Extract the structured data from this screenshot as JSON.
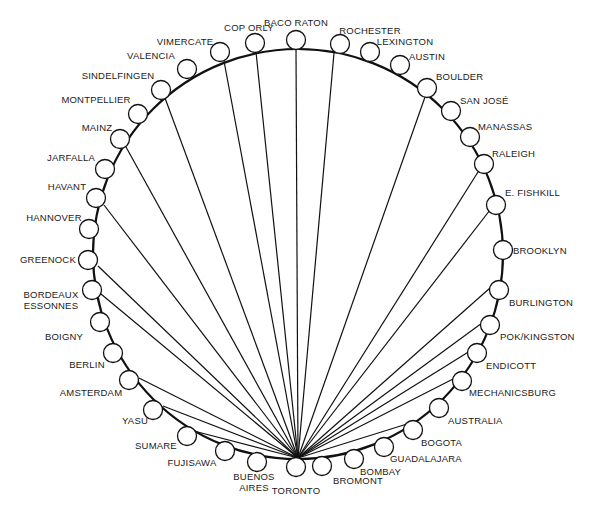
{
  "diagram": {
    "type": "star-network-on-ring",
    "hub": "TORONTO",
    "ring": {
      "cx": 298,
      "cy": 254,
      "r": 205,
      "stroke": "#111111"
    },
    "node_radius": 9.5,
    "nodes": [
      {
        "id": "baco-raton",
        "label": [
          "BACO RATON"
        ],
        "x": 296,
        "y": 40,
        "lx": 296,
        "ly": 26,
        "anchor": "middle",
        "connected": true,
        "ex": 296,
        "ey": 49
      },
      {
        "id": "rochester",
        "label": [
          "ROCHESTER"
        ],
        "x": 340,
        "y": 44,
        "lx": 370,
        "ly": 34,
        "anchor": "middle",
        "connected": true,
        "ex": 334,
        "ey": 53
      },
      {
        "id": "lexington",
        "label": [
          "LEXINGTON"
        ],
        "x": 370,
        "y": 52,
        "lx": 405,
        "ly": 45,
        "anchor": "middle",
        "connected": false
      },
      {
        "id": "austin",
        "label": [
          "AUSTIN"
        ],
        "x": 400,
        "y": 65,
        "lx": 427,
        "ly": 60,
        "anchor": "middle",
        "connected": false
      },
      {
        "id": "boulder",
        "label": [
          "BOULDER"
        ],
        "x": 427,
        "y": 88,
        "lx": 436,
        "ly": 80,
        "anchor": "start",
        "connected": true,
        "ex": 425,
        "ey": 97
      },
      {
        "id": "san-jose",
        "label": [
          "SAN JOSÉ"
        ],
        "x": 451,
        "y": 111,
        "lx": 460,
        "ly": 104,
        "anchor": "start",
        "connected": false
      },
      {
        "id": "manassas",
        "label": [
          "MANASSAS"
        ],
        "x": 470,
        "y": 137,
        "lx": 478,
        "ly": 130,
        "anchor": "start",
        "connected": false
      },
      {
        "id": "raleigh",
        "label": [
          "RALEIGH"
        ],
        "x": 484,
        "y": 164,
        "lx": 492,
        "ly": 157,
        "anchor": "start",
        "connected": true,
        "ex": 478,
        "ey": 172
      },
      {
        "id": "e-fishkill",
        "label": [
          "E. FISHKILL"
        ],
        "x": 496,
        "y": 205,
        "lx": 505,
        "ly": 196,
        "anchor": "start",
        "connected": true,
        "ex": 490,
        "ey": 210
      },
      {
        "id": "brooklyn",
        "label": [
          "BROOKLYN"
        ],
        "x": 503,
        "y": 250,
        "lx": 513,
        "ly": 254,
        "anchor": "start",
        "connected": false
      },
      {
        "id": "burlington",
        "label": [
          "BURLINGTON"
        ],
        "x": 499,
        "y": 290,
        "lx": 509,
        "ly": 306,
        "anchor": "start",
        "connected": true,
        "ex": 490,
        "ey": 288
      },
      {
        "id": "pok-kingston",
        "label": [
          "POK/KINGSTON"
        ],
        "x": 490,
        "y": 325,
        "lx": 500,
        "ly": 340,
        "anchor": "start",
        "connected": true,
        "ex": 482,
        "ey": 323
      },
      {
        "id": "endicott",
        "label": [
          "ENDICOTT"
        ],
        "x": 477,
        "y": 353,
        "lx": 486,
        "ly": 369,
        "anchor": "start",
        "connected": true,
        "ex": 470,
        "ey": 351
      },
      {
        "id": "mechanicsburg",
        "label": [
          "MECHANICSBURG"
        ],
        "x": 462,
        "y": 381,
        "lx": 469,
        "ly": 396,
        "anchor": "start",
        "connected": true,
        "ex": 455,
        "ey": 378
      },
      {
        "id": "australia",
        "label": [
          "AUSTRALIA"
        ],
        "x": 439,
        "y": 408,
        "lx": 448,
        "ly": 424,
        "anchor": "start",
        "connected": false
      },
      {
        "id": "bogota",
        "label": [
          "BOGOTA"
        ],
        "x": 413,
        "y": 430,
        "lx": 421,
        "ly": 446,
        "anchor": "start",
        "connected": true,
        "ex": 407,
        "ey": 424
      },
      {
        "id": "guadalajara",
        "label": [
          "GUADALAJARA"
        ],
        "x": 384,
        "y": 447,
        "lx": 390,
        "ly": 462,
        "anchor": "start",
        "connected": false
      },
      {
        "id": "bombay",
        "label": [
          "BOMBAY"
        ],
        "x": 354,
        "y": 459,
        "lx": 360,
        "ly": 475,
        "anchor": "start",
        "connected": false
      },
      {
        "id": "bromont",
        "label": [
          "BROMONT"
        ],
        "x": 322,
        "y": 466,
        "lx": 333,
        "ly": 484,
        "anchor": "start",
        "connected": false
      },
      {
        "id": "toronto",
        "label": [
          "TORONTO"
        ],
        "x": 296,
        "y": 467,
        "lx": 296,
        "ly": 494,
        "anchor": "middle",
        "connected": false,
        "hub": true
      },
      {
        "id": "buenos-aires",
        "label": [
          "BUENOS",
          "AIRES"
        ],
        "x": 257,
        "y": 462,
        "lx": 254,
        "ly": 480,
        "anchor": "middle",
        "connected": false
      },
      {
        "id": "fujisawa",
        "label": [
          "FUJISAWA"
        ],
        "x": 225,
        "y": 451,
        "lx": 192,
        "ly": 466,
        "anchor": "middle",
        "connected": false
      },
      {
        "id": "sumare",
        "label": [
          "SUMARE"
        ],
        "x": 187,
        "y": 436,
        "lx": 156,
        "ly": 449,
        "anchor": "middle",
        "connected": true,
        "ex": 190,
        "ey": 430
      },
      {
        "id": "yasu",
        "label": [
          "YASU"
        ],
        "x": 153,
        "y": 410,
        "lx": 135,
        "ly": 424,
        "anchor": "middle",
        "connected": true,
        "ex": 163,
        "ey": 406
      },
      {
        "id": "amsterdam",
        "label": [
          "AMSTERDAM"
        ],
        "x": 129,
        "y": 380,
        "lx": 91,
        "ly": 396,
        "anchor": "middle",
        "connected": true,
        "ex": 139,
        "ey": 378
      },
      {
        "id": "berlin",
        "label": [
          "BERLIN"
        ],
        "x": 113,
        "y": 353,
        "lx": 87,
        "ly": 368,
        "anchor": "middle",
        "connected": false
      },
      {
        "id": "boigny",
        "label": [
          "BOIGNY"
        ],
        "x": 100,
        "y": 322,
        "lx": 64,
        "ly": 340,
        "anchor": "middle",
        "connected": false
      },
      {
        "id": "bordeaux-essonnes",
        "label": [
          "BORDEAUX",
          "ESSONNES"
        ],
        "x": 92,
        "y": 290,
        "lx": 51,
        "ly": 298,
        "anchor": "middle",
        "connected": true,
        "ex": 101,
        "ey": 294
      },
      {
        "id": "greenock",
        "label": [
          "GREENOCK"
        ],
        "x": 88,
        "y": 260,
        "lx": 48,
        "ly": 263,
        "anchor": "middle",
        "connected": true,
        "ex": 98,
        "ey": 266
      },
      {
        "id": "hannover",
        "label": [
          "HANNOVER"
        ],
        "x": 89,
        "y": 229,
        "lx": 54,
        "ly": 221,
        "anchor": "middle",
        "connected": false
      },
      {
        "id": "havant",
        "label": [
          "HAVANT"
        ],
        "x": 96,
        "y": 198,
        "lx": 67,
        "ly": 190,
        "anchor": "middle",
        "connected": true,
        "ex": 104,
        "ey": 205
      },
      {
        "id": "jarfalla",
        "label": [
          "JARFALLA"
        ],
        "x": 105,
        "y": 169,
        "lx": 71,
        "ly": 161,
        "anchor": "middle",
        "connected": false
      },
      {
        "id": "mainz",
        "label": [
          "MAINZ"
        ],
        "x": 120,
        "y": 139,
        "lx": 97,
        "ly": 131,
        "anchor": "middle",
        "connected": true,
        "ex": 126,
        "ey": 147
      },
      {
        "id": "montpellier",
        "label": [
          "MONTPELLIER"
        ],
        "x": 138,
        "y": 114,
        "lx": 96,
        "ly": 103,
        "anchor": "middle",
        "connected": false
      },
      {
        "id": "sindelfingen",
        "label": [
          "SINDELFINGEN"
        ],
        "x": 161,
        "y": 90,
        "lx": 118,
        "ly": 79,
        "anchor": "middle",
        "connected": true,
        "ex": 165,
        "ey": 98
      },
      {
        "id": "valencia",
        "label": [
          "VALENCIA"
        ],
        "x": 187,
        "y": 69,
        "lx": 151,
        "ly": 59,
        "anchor": "middle",
        "connected": false
      },
      {
        "id": "vimercate",
        "label": [
          "VIMERCATE"
        ],
        "x": 220,
        "y": 52,
        "lx": 185,
        "ly": 45,
        "anchor": "middle",
        "connected": true,
        "ex": 224,
        "ey": 61
      },
      {
        "id": "cop-orly",
        "label": [
          "COP ORLY"
        ],
        "x": 255,
        "y": 43,
        "lx": 249,
        "ly": 31,
        "anchor": "middle",
        "connected": true,
        "ex": 256,
        "ey": 52
      }
    ],
    "hub_point": {
      "x": 298,
      "y": 458
    }
  }
}
